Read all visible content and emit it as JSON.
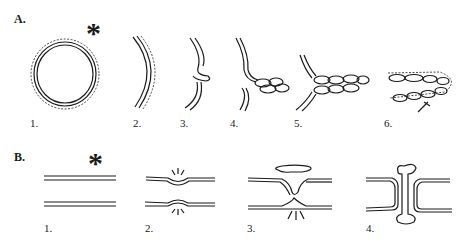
{
  "figure": {
    "sections": [
      {
        "label": "A.",
        "panels": [
          {
            "number": "1."
          },
          {
            "number": "2."
          },
          {
            "number": "3."
          },
          {
            "number": "4."
          },
          {
            "number": "5."
          },
          {
            "number": "6."
          }
        ]
      },
      {
        "label": "B.",
        "panels": [
          {
            "number": "1."
          },
          {
            "number": "2."
          },
          {
            "number": "3."
          },
          {
            "number": "4."
          }
        ]
      }
    ],
    "marker_symbol": "*",
    "colors": {
      "ink": "#1a1a1a",
      "background": "#ffffff"
    }
  }
}
